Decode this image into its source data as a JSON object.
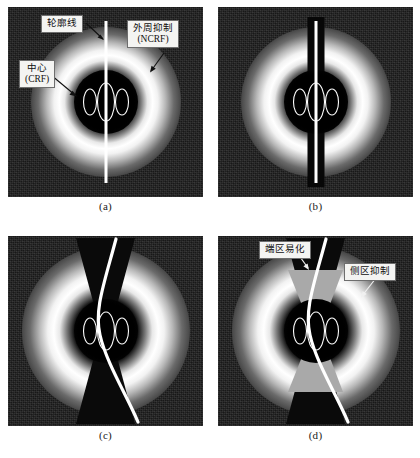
{
  "figure": {
    "panels": [
      {
        "id": "a",
        "caption": "(a)",
        "labels": [
          {
            "name": "contour-line",
            "line1": "轮廓线",
            "line2": ""
          },
          {
            "name": "surround-suppression",
            "line1": "外周抑制",
            "line2": "(NCRF)"
          },
          {
            "name": "center-crf",
            "line1": "中心",
            "line2": "(CRF)"
          }
        ]
      },
      {
        "id": "b",
        "caption": "(b)",
        "labels": []
      },
      {
        "id": "c",
        "caption": "(c)",
        "labels": []
      },
      {
        "id": "d",
        "caption": "(d)",
        "labels": [
          {
            "name": "end-zone-facilitation",
            "line1": "端区易化",
            "line2": ""
          },
          {
            "name": "side-zone-inhibition",
            "line1": "侧区抑制",
            "line2": ""
          }
        ]
      }
    ]
  },
  "colors": {
    "page_background": "#ffffff",
    "panel_background": "#151515",
    "contour_line": "#ffffff",
    "halo_peak": "#ffffff",
    "crf_disc": "#000000",
    "wedge_grey": "#a9a9a9",
    "label_box": "#f4f4f2",
    "label_border": "#6e6e6e",
    "label_text": "#101010",
    "caption_text": "#1a1a1a"
  }
}
